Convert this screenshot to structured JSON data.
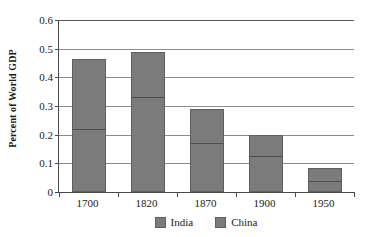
{
  "chart_data": {
    "type": "bar",
    "stacked": true,
    "title": "",
    "xlabel": "",
    "ylabel": "Percent of World GDP",
    "categories": [
      "1700",
      "1820",
      "1870",
      "1900",
      "1950"
    ],
    "series": [
      {
        "name": "India",
        "values": [
          0.22,
          0.33,
          0.17,
          0.125,
          0.04
        ]
      },
      {
        "name": "China",
        "values": [
          0.245,
          0.16,
          0.12,
          0.075,
          0.045
        ]
      }
    ],
    "totals": [
      0.465,
      0.49,
      0.29,
      0.2,
      0.085
    ],
    "ylim": [
      0,
      0.6
    ],
    "ytick_labels": [
      "0",
      "0.1",
      "0.2",
      "0.3",
      "0.4",
      "0.5",
      "0.6"
    ],
    "ytick_values": [
      0,
      0.1,
      0.2,
      0.3,
      0.4,
      0.5,
      0.6
    ],
    "grid": true,
    "legend_position": "bottom",
    "legend": [
      "India",
      "China"
    ],
    "colors": {
      "bar_fill": "#7b7b7b",
      "bar_stroke": "#5f5f5f",
      "gridline": "#8c8c8c",
      "axis": "#4a4a4a",
      "background": "#ffffff",
      "text": "#1a1a1a"
    }
  }
}
